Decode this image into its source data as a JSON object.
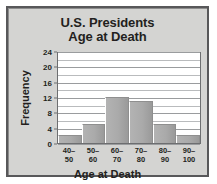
{
  "chart_data": {
    "type": "bar",
    "title": "U.S. Presidents Age at Death",
    "title_lines": [
      "U.S. Presidents",
      "Age at Death"
    ],
    "xlabel": "Age at Death",
    "ylabel": "Frequency",
    "categories": [
      "40–50",
      "50–60",
      "60–70",
      "70–80",
      "80–90",
      "90–100"
    ],
    "category_lines": [
      {
        "lo": "40–",
        "hi": "50"
      },
      {
        "lo": "50–",
        "hi": "60"
      },
      {
        "lo": "60–",
        "hi": "70"
      },
      {
        "lo": "70–",
        "hi": "80"
      },
      {
        "lo": "80–",
        "hi": "90"
      },
      {
        "lo": "90–",
        "hi": "100"
      }
    ],
    "values": [
      2,
      5,
      12,
      11,
      5,
      2
    ],
    "ylim": [
      0,
      24
    ],
    "ytick_labels": [
      "0",
      "4",
      "8",
      "12",
      "16",
      "20",
      "24"
    ],
    "ytick_values": [
      0,
      4,
      8,
      12,
      16,
      20,
      24
    ],
    "gridline_interval": 2,
    "grid": true,
    "legend": "none",
    "bar_color": "#aaaaaa",
    "panel_color": "#d4d4d2",
    "plot_background": "#ffffff",
    "text_color": "#231f20"
  }
}
